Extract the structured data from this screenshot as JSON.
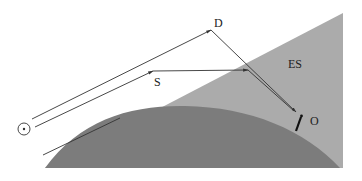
{
  "diagram": {
    "labels": {
      "d": "D",
      "s": "S",
      "es": "ES",
      "o": "O"
    },
    "icons": {
      "sun": "sun-symbol-circle-dot",
      "observer": "observer-figure"
    },
    "colors": {
      "background": "#ffffff",
      "es_region": "#a9a9a9",
      "earth": "#7a7a7a",
      "lines": "#333333"
    }
  }
}
